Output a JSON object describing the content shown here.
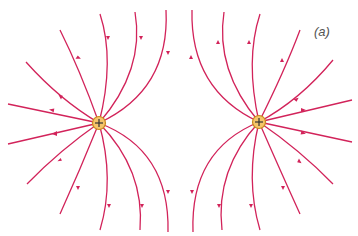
{
  "figure": {
    "panel_label": "(a)",
    "line_color": "#d2235a",
    "charge_fill": "#f5c46a",
    "charge_stroke": "#c98a1c",
    "charges": [
      {
        "id": "left",
        "sign": "+",
        "x": 99,
        "y": 123
      },
      {
        "id": "right",
        "sign": "+",
        "x": 259,
        "y": 122
      }
    ]
  }
}
